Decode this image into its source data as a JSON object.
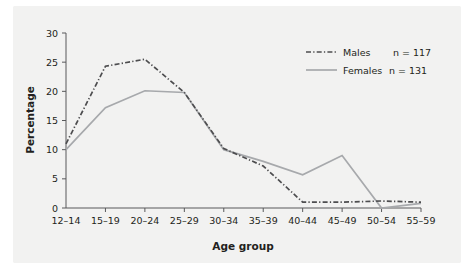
{
  "chart_data": {
    "type": "line",
    "title": "",
    "xlabel": "Age group",
    "ylabel": "Percentage",
    "categories": [
      "12–14",
      "15–19",
      "20–24",
      "25–29",
      "30–34",
      "35–39",
      "40–44",
      "45–49",
      "50–54",
      "55–59"
    ],
    "series": [
      {
        "name": "Males",
        "n_label": "n = 117",
        "style": "dash-dot",
        "color": "#4d4d4f",
        "values": [
          11.0,
          24.3,
          25.5,
          19.8,
          10.2,
          7.2,
          1.0,
          1.0,
          1.2,
          1.0
        ]
      },
      {
        "name": "Females",
        "n_label": "n = 131",
        "style": "solid",
        "color": "#a7a9ac",
        "values": [
          10.0,
          17.2,
          20.1,
          19.8,
          10.0,
          8.0,
          5.7,
          9.0,
          0.0,
          0.8
        ]
      }
    ],
    "yticks": [
      0,
      5,
      10,
      15,
      20,
      25,
      30
    ],
    "ylim": [
      0,
      30
    ],
    "xlim_categories": 10,
    "grid": false,
    "legend_position": "top-right",
    "background_color": "#f2f2f1",
    "axis_color": "#58595b"
  },
  "legend": {
    "entries": [
      {
        "label": "Males",
        "count": "n = 117"
      },
      {
        "label": "Females",
        "count": "n = 131"
      }
    ]
  },
  "axes": {
    "y_title": "Percentage",
    "x_title": "Age group",
    "y_tick_labels": [
      "0",
      "5",
      "10",
      "15",
      "20",
      "25",
      "30"
    ],
    "x_tick_labels": [
      "12–14",
      "15–19",
      "20–24",
      "25–29",
      "30–34",
      "35–39",
      "40–44",
      "45–49",
      "50–54",
      "55–59"
    ]
  }
}
